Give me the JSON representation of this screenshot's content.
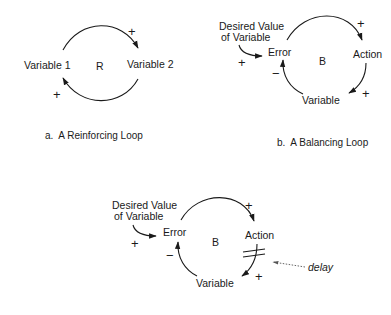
{
  "diagrams": [
    {
      "id": "a",
      "caption": "a.  A Reinforcing Loop",
      "loop_label": "R",
      "nodes": [
        "Variable 1",
        "Variable 2"
      ],
      "links": [
        {
          "from": "Variable 1",
          "to": "Variable 2",
          "polarity": "+"
        },
        {
          "from": "Variable 2",
          "to": "Variable 1",
          "polarity": "+"
        }
      ]
    },
    {
      "id": "b",
      "caption": "b.  A Balancing Loop",
      "loop_label": "B",
      "goal_line1": "Desired Value",
      "goal_line2": "of Variable",
      "nodes": [
        "Error",
        "Action",
        "Variable"
      ],
      "links": [
        {
          "from": "Desired Value of Variable",
          "to": "Error",
          "polarity": "+"
        },
        {
          "from": "Error",
          "to": "Action",
          "polarity": "+"
        },
        {
          "from": "Action",
          "to": "Variable",
          "polarity": "+"
        },
        {
          "from": "Variable",
          "to": "Error",
          "polarity": "−"
        }
      ]
    },
    {
      "id": "c",
      "caption": "",
      "loop_label": "B",
      "goal_line1": "Desired Value",
      "goal_line2": "of Variable",
      "nodes": [
        "Error",
        "Action",
        "Variable"
      ],
      "delay_label": "delay",
      "links": [
        {
          "from": "Desired Value of Variable",
          "to": "Error",
          "polarity": "+"
        },
        {
          "from": "Error",
          "to": "Action",
          "polarity": "+"
        },
        {
          "from": "Action",
          "to": "Variable",
          "polarity": "+",
          "delay": true
        },
        {
          "from": "Variable",
          "to": "Error",
          "polarity": "−"
        }
      ]
    }
  ],
  "colors": {
    "ink": "#1a1a1a",
    "background": "#ffffff",
    "dotted": "#666666"
  }
}
